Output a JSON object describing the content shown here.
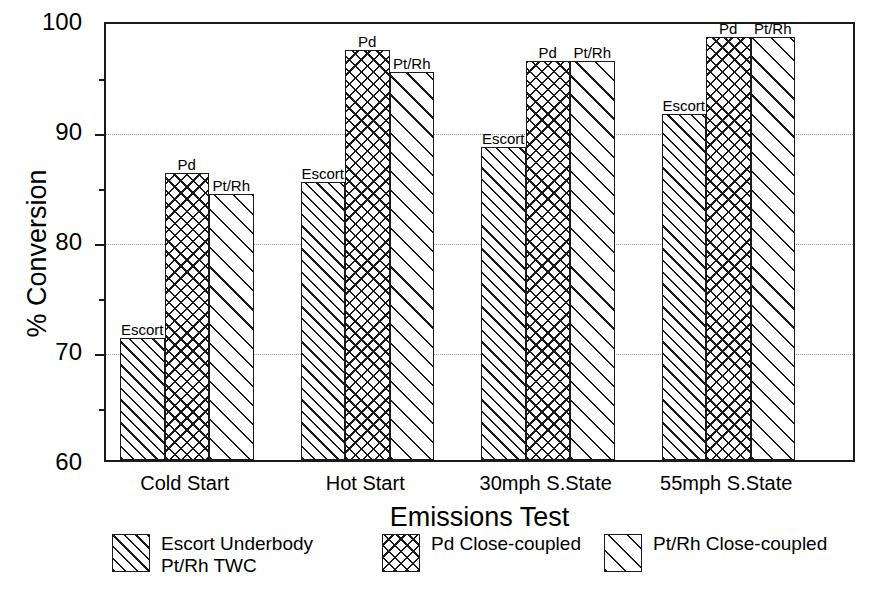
{
  "chart_data": {
    "type": "bar",
    "title": "",
    "xlabel": "Emissions Test",
    "ylabel": "% Conversion",
    "ylim": [
      60,
      100
    ],
    "ytick_values": [
      60,
      70,
      80,
      90,
      100
    ],
    "ytick_labels": [
      "60",
      "70",
      "80",
      "90",
      "100"
    ],
    "yminor_ticks": [
      65,
      75,
      85,
      95
    ],
    "grid": "horizontal-dotted-at-70-80-90",
    "legend_position": "below-axes",
    "categories": [
      "Cold Start",
      "Hot Start",
      "30mph S.State",
      "55mph S.State"
    ],
    "series": [
      {
        "name": "Escort Underbody Pt/Rh TWC",
        "short_name": "Escort",
        "pattern": "diagonal-hatch",
        "values": [
          71.1,
          85.3,
          88.5,
          91.5
        ]
      },
      {
        "name": "Pd Close-coupled",
        "short_name": "Pd",
        "pattern": "cross-hatch",
        "values": [
          86.1,
          97.3,
          96.3,
          98.5
        ]
      },
      {
        "name": "Pt/Rh Close-coupled",
        "short_name": "Pt/Rh",
        "pattern": "wide-diagonal-hatch",
        "values": [
          84.2,
          95.3,
          96.3,
          98.5
        ]
      }
    ],
    "bar_annotations": [
      [
        "Escort",
        "Pd",
        "Pt/Rh"
      ],
      [
        "Escort",
        "Pd",
        "Pt/Rh"
      ],
      [
        "Escort",
        "Pd",
        "Pt/Rh"
      ],
      [
        "Escort",
        "Pd",
        "Pt/Rh"
      ]
    ],
    "colors": {
      "axis": "#1a1a1a",
      "grid": "#9a9a9a",
      "bar_fill": "#ffffff",
      "bar_edge": "#1a1a1a",
      "background": "#ffffff"
    }
  },
  "axes": {
    "y_title": "% Conversion",
    "x_title": "Emissions Test",
    "y_labels": [
      "100",
      "90",
      "80",
      "70",
      "60"
    ],
    "x_labels": [
      "Cold Start",
      "Hot Start",
      "30mph S.State",
      "55mph S.State"
    ]
  },
  "legend": {
    "entries": [
      {
        "label": "Escort Underbody\nPt/Rh TWC",
        "pattern": "diagonal-hatch"
      },
      {
        "label": "Pd Close-coupled",
        "pattern": "cross-hatch"
      },
      {
        "label": "Pt/Rh Close-coupled",
        "pattern": "wide-diagonal-hatch"
      }
    ]
  },
  "bar_labels": {
    "g0": [
      "Escort",
      "Pd",
      "Pt/Rh"
    ],
    "g1": [
      "Escort",
      "Pd",
      "Pt/Rh"
    ],
    "g2": [
      "Escort",
      "Pd",
      "Pt/Rh"
    ],
    "g3": [
      "Escort",
      "Pd",
      "Pt/Rh"
    ]
  }
}
